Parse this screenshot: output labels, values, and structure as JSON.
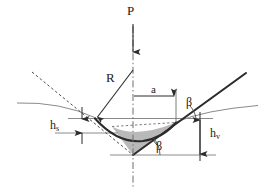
{
  "figure": {
    "colors": {
      "stroke_dark": "#2b2b2b",
      "stroke_mid": "#6e6e6e",
      "stroke_light": "#8a8a8a",
      "shade_fill": "#b9b9b9",
      "background": "#ffffff"
    }
  },
  "labels": {
    "load": "P",
    "radius": "R",
    "contact_radius": "a",
    "angle_upper": "β",
    "angle_lower": "β",
    "pileup_height_base": "h",
    "pileup_height_sub": "s",
    "depth_base": "h",
    "depth_sub": "v"
  },
  "elements": {
    "load_arrow": "vertical-down-arrow",
    "radius_arrow": "diagonal-arrow-to-contact-point",
    "contact_dimension_arrow": "horizontal-right-arrow",
    "pileup_dimension_arrow": "vertical-double-arrow",
    "depth_dimension_arrow": "vertical-double-arrow",
    "centerline": "dash-dot-vertical",
    "tangent_line": "dashed-diagonal",
    "shaded_region": "gray-triangle"
  }
}
